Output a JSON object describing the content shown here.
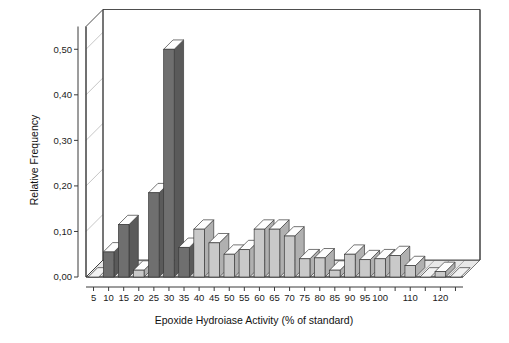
{
  "chart_data": {
    "type": "bar",
    "title": "",
    "xlabel": "Epoxide Hydroiase Activity (% of standard)",
    "ylabel": "Relative Frequency",
    "ylim": [
      0.0,
      0.55
    ],
    "ytick_labels": [
      "0,00",
      "0,10",
      "0,20",
      "0,30",
      "0,40",
      "0,50"
    ],
    "ytick_values": [
      0.0,
      0.1,
      0.2,
      0.3,
      0.4,
      0.5
    ],
    "xtick_labels": [
      "5",
      "10",
      "15",
      "20",
      "25",
      "30",
      "35",
      "40",
      "45",
      "50",
      "55",
      "60",
      "65",
      "70",
      "75",
      "80",
      "85",
      "90",
      "95",
      "100",
      "",
      "110",
      "",
      "120",
      ""
    ],
    "categories": [
      "5",
      "10",
      "15",
      "20",
      "25",
      "30",
      "35",
      "40",
      "45",
      "50",
      "55",
      "60",
      "65",
      "70",
      "75",
      "80",
      "85",
      "90",
      "95",
      "100",
      "105",
      "110",
      "115",
      "120",
      "125"
    ],
    "values": [
      0.0,
      0.055,
      0.115,
      0.015,
      0.185,
      0.5,
      0.065,
      0.105,
      0.075,
      0.05,
      0.06,
      0.105,
      0.105,
      0.09,
      0.04,
      0.042,
      0.015,
      0.05,
      0.038,
      0.04,
      0.047,
      0.025,
      0.0,
      0.012,
      0.0
    ],
    "bar_colors": [
      "light",
      "dark",
      "dark",
      "light",
      "dark",
      "dark",
      "dark",
      "light",
      "light",
      "light",
      "light",
      "light",
      "light",
      "light",
      "light",
      "light",
      "light",
      "light",
      "light",
      "light",
      "light",
      "light",
      "light",
      "light",
      "light"
    ],
    "grid": "horizontal",
    "legend": "none",
    "style": "3d-column",
    "colors": {
      "dark_bar": "#6f6f6f",
      "light_bar": "#c9c9c9",
      "bar_outline": "#3a3a3a",
      "grid_line": "#b8b8b8",
      "axis_line": "#3a3a3a",
      "floor": "#e8e8e8",
      "background": "#ffffff"
    }
  },
  "figure": {
    "x_axis_title": "Epoxide Hydroiase Activity (% of standard)",
    "y_axis_title": "Relative Frequency"
  }
}
